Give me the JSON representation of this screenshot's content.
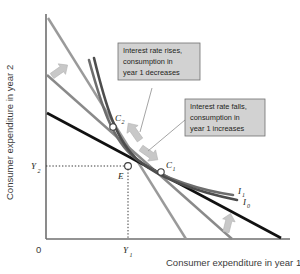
{
  "figure": {
    "type": "economics-indifference-curve-diagram",
    "axes": {
      "y_label": "Consumer expenditure in year 2",
      "x_label": "Consumer expenditure in year 1",
      "origin_label": "0",
      "y_tick_label": "Y",
      "y_tick_sub": "2",
      "x_tick_label": "Y",
      "x_tick_sub": "1"
    },
    "points": [
      {
        "id": "point-e",
        "label": "E",
        "sub": "",
        "x": 128,
        "y": 166
      },
      {
        "id": "point-c2",
        "label": "C",
        "sub": "2",
        "x": 113,
        "y": 126
      },
      {
        "id": "point-c1",
        "label": "C",
        "sub": "1",
        "x": 162,
        "y": 172
      }
    ],
    "curves": [
      {
        "id": "curve-i1",
        "label": "I",
        "sub": "1",
        "color": "#6d6d6d"
      },
      {
        "id": "curve-i0",
        "label": "I",
        "sub": "0",
        "color": "#4d4d4d"
      }
    ],
    "budget_lines": [
      {
        "id": "budget-line-steep",
        "color": "#9a9a9a"
      },
      {
        "id": "budget-line-mid",
        "color": "#8a8a8a"
      },
      {
        "id": "budget-line-flat",
        "color": "#111111"
      }
    ],
    "callouts": [
      {
        "id": "callout-rate-rises",
        "lines": [
          "Interest rate rises,",
          "consumption in",
          "year 1 decreases"
        ]
      },
      {
        "id": "callout-rate-falls",
        "lines": [
          "Interest rate falls,",
          "consumption in",
          "year 1 increases"
        ]
      }
    ],
    "colors": {
      "callout_fill": "#d2d2d2",
      "callout_border": "#6f6f6f",
      "arrow_fill": "#c8c8c8",
      "axis": "#6f6f6f",
      "text": "#231f20"
    }
  }
}
